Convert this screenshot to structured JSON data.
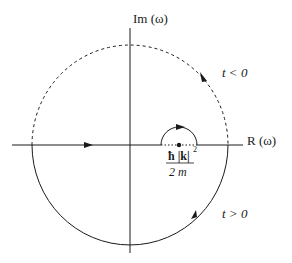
{
  "diagram": {
    "axes": {
      "imag_label": "Im (ω)",
      "real_label": "R (ω)"
    },
    "regions": {
      "upper_label": "t < 0",
      "lower_label": "t > 0"
    },
    "pole": {
      "numerator": "ħ |k|",
      "exponent": "2",
      "denominator": "2 m"
    },
    "colors": {
      "ink": "#1a1a1a",
      "background": "#ffffff"
    }
  }
}
